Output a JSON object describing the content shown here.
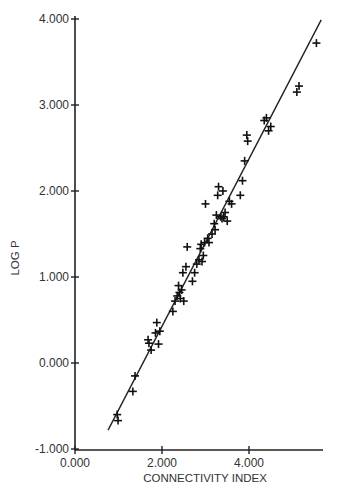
{
  "chart_data": {
    "type": "scatter",
    "title": "",
    "xlabel": "CONNECTIVITY INDEX",
    "ylabel": "LOG P",
    "xlim": [
      0,
      5.8
    ],
    "ylim": [
      -1,
      4.1
    ],
    "x_ticks": [
      0,
      2,
      4
    ],
    "x_tick_labels": [
      "0.000",
      "2.000",
      "4.000"
    ],
    "y_ticks": [
      -1,
      0,
      1,
      2,
      3,
      4
    ],
    "y_tick_labels": [
      "-1.000",
      "0.000",
      "1.000",
      "2.000",
      "3.000",
      "4.000"
    ],
    "grid": false,
    "legend": null,
    "marker": "+",
    "fit_line": {
      "x": [
        0.76,
        5.66
      ],
      "y": [
        -0.78,
        3.99
      ]
    },
    "series": [
      {
        "name": "compounds",
        "points": [
          [
            0.97,
            -0.6
          ],
          [
            0.99,
            -0.67
          ],
          [
            1.38,
            -0.15
          ],
          [
            1.33,
            -0.33
          ],
          [
            1.7,
            0.23
          ],
          [
            1.75,
            0.15
          ],
          [
            1.85,
            0.35
          ],
          [
            1.88,
            0.47
          ],
          [
            1.92,
            0.22
          ],
          [
            1.95,
            0.37
          ],
          [
            1.68,
            0.27
          ],
          [
            2.25,
            0.6
          ],
          [
            2.3,
            0.72
          ],
          [
            2.35,
            0.78
          ],
          [
            2.38,
            0.9
          ],
          [
            2.42,
            0.75
          ],
          [
            2.45,
            0.85
          ],
          [
            2.48,
            1.05
          ],
          [
            2.5,
            0.72
          ],
          [
            2.55,
            1.12
          ],
          [
            2.58,
            1.35
          ],
          [
            2.4,
            0.82
          ],
          [
            2.7,
            0.95
          ],
          [
            2.75,
            1.05
          ],
          [
            2.8,
            1.15
          ],
          [
            2.85,
            1.2
          ],
          [
            2.88,
            1.33
          ],
          [
            2.9,
            1.38
          ],
          [
            2.95,
            1.25
          ],
          [
            2.98,
            1.4
          ],
          [
            3.0,
            1.85
          ],
          [
            3.05,
            1.45
          ],
          [
            3.08,
            1.4
          ],
          [
            2.92,
            1.18
          ],
          [
            3.15,
            1.5
          ],
          [
            3.2,
            1.62
          ],
          [
            3.25,
            1.72
          ],
          [
            3.28,
            1.95
          ],
          [
            3.3,
            2.05
          ],
          [
            3.35,
            1.7
          ],
          [
            3.38,
            1.68
          ],
          [
            3.4,
            2.0
          ],
          [
            3.45,
            1.75
          ],
          [
            3.5,
            1.65
          ],
          [
            3.55,
            1.88
          ],
          [
            3.6,
            1.85
          ],
          [
            3.22,
            1.55
          ],
          [
            3.42,
            1.7
          ],
          [
            3.8,
            1.95
          ],
          [
            3.85,
            2.12
          ],
          [
            3.9,
            2.35
          ],
          [
            3.95,
            2.65
          ],
          [
            3.97,
            2.58
          ],
          [
            4.35,
            2.82
          ],
          [
            4.4,
            2.85
          ],
          [
            4.45,
            2.7
          ],
          [
            4.5,
            2.75
          ],
          [
            5.1,
            3.15
          ],
          [
            5.15,
            3.22
          ],
          [
            5.55,
            3.72
          ]
        ]
      }
    ]
  }
}
